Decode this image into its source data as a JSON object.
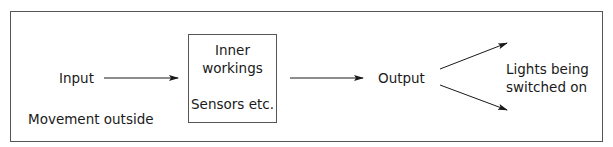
{
  "diagram": {
    "input_label": "Input",
    "input_example": "Movement outside",
    "process_box": {
      "title_line1": "Inner",
      "title_line2": "workings",
      "subtitle": "Sensors etc."
    },
    "output_label": "Output",
    "output_example_line1": "Lights being",
    "output_example_line2": "switched on",
    "colors": {
      "line": "#1a1a1a",
      "frame": "#555555",
      "background": "#ffffff"
    },
    "arrows": [
      {
        "from": "Input",
        "to": "Inner workings"
      },
      {
        "from": "Inner workings",
        "to": "Output"
      },
      {
        "from": "Output",
        "to": "Lights being switched on (upper)"
      },
      {
        "from": "Output",
        "to": "Lights being switched on (lower)"
      }
    ]
  }
}
